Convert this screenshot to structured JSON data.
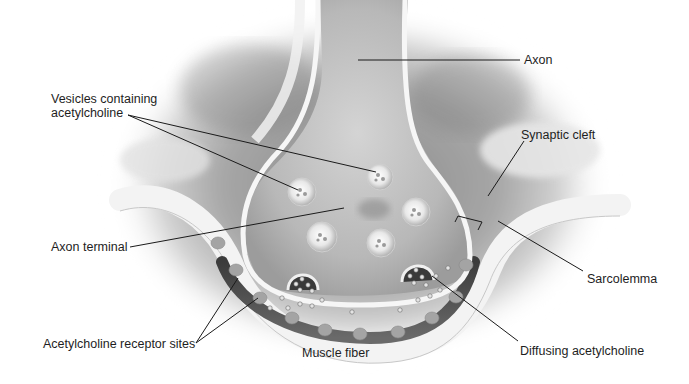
{
  "diagram": {
    "labels": {
      "axon": "Axon",
      "vesicles_line1": "Vesicles containing",
      "vesicles_line2": "acetylcholine",
      "synaptic_cleft": "Synaptic cleft",
      "axon_terminal": "Axon terminal",
      "sarcolemma": "Sarcolemma",
      "receptor_sites": "Acetylcholine receptor sites",
      "muscle_fiber": "Muscle fiber",
      "diffusing_ach": "Diffusing acetylcholine"
    },
    "colors": {
      "background": "#ffffff",
      "label_text": "#1e1e1e",
      "leader_line": "#1a1a1a",
      "membrane": "#f2f2f2",
      "cytoplasm": "#bdbdbd",
      "cleft": "#5a5a5a",
      "receptor": "#9a9a9a"
    }
  }
}
